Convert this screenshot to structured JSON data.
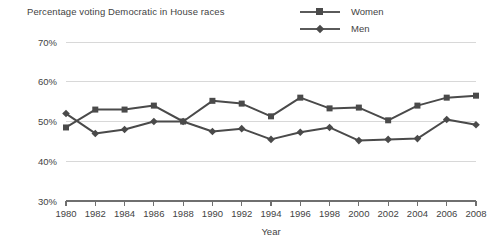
{
  "chart_data": {
    "type": "line",
    "title": "Percentage voting Democratic in House races",
    "xlabel": "Year",
    "ylabel": "",
    "grid": true,
    "legend_position": "top-right",
    "xlim": [
      1980,
      2008
    ],
    "ylim": [
      30,
      70
    ],
    "ytick_labels": [
      "70%",
      "60%",
      "50%",
      "40%",
      "30%"
    ],
    "ytick_values": [
      70,
      60,
      50,
      40,
      30
    ],
    "categories": [
      1980,
      1982,
      1984,
      1986,
      1988,
      1990,
      1992,
      1994,
      1996,
      1998,
      2000,
      2002,
      2004,
      2006,
      2008
    ],
    "xtick_labels": [
      "1980",
      "1982",
      "1984",
      "1986",
      "1988",
      "1990",
      "1992",
      "1994",
      "1996",
      "1998",
      "2000",
      "2002",
      "2004",
      "2006",
      "2008"
    ],
    "series": [
      {
        "name": "Women",
        "marker": "square",
        "color": "#4a4a4a",
        "values": [
          48.5,
          53.0,
          53.0,
          54.0,
          50.0,
          55.2,
          54.5,
          51.3,
          56.0,
          53.3,
          53.5,
          50.3,
          54.0,
          56.0,
          56.5
        ]
      },
      {
        "name": "Men",
        "marker": "diamond",
        "color": "#4a4a4a",
        "values": [
          52.0,
          47.0,
          48.0,
          50.0,
          50.0,
          47.5,
          48.2,
          45.5,
          47.3,
          48.5,
          45.2,
          45.5,
          45.7,
          50.5,
          49.2
        ]
      }
    ]
  },
  "legend": {
    "items": [
      {
        "label": "Women"
      },
      {
        "label": "Men"
      }
    ]
  },
  "axes": {
    "x_title": "Year"
  }
}
